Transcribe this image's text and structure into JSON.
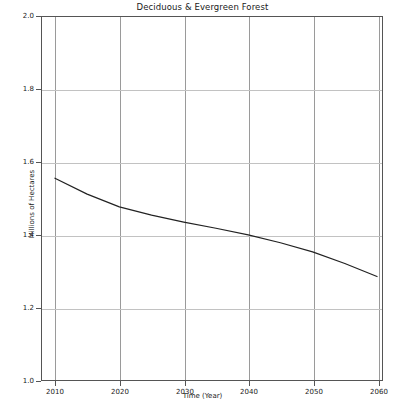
{
  "chart_data": {
    "type": "line",
    "title": "Deciduous & Evergreen Forest",
    "xlabel": "Time (Year)",
    "ylabel": "Millions of Hectares",
    "xlim": [
      2010,
      2060
    ],
    "ylim": [
      1.0,
      2.0
    ],
    "grid": true,
    "legend": null,
    "xticks": [
      "2010",
      "2020",
      "2030",
      "2040",
      "2050",
      "2060"
    ],
    "yticks": [
      "1.0",
      "1.2",
      "1.4",
      "1.6",
      "1.8",
      "2.0"
    ],
    "x": [
      2010,
      2015,
      2020,
      2025,
      2030,
      2035,
      2040,
      2045,
      2050,
      2055,
      2060
    ],
    "values": [
      1.556,
      1.512,
      1.477,
      1.454,
      1.435,
      1.418,
      1.4,
      1.378,
      1.353,
      1.321,
      1.285
    ],
    "series": [
      {
        "name": "Deciduous & Evergreen Forest",
        "color": "#222222",
        "values": [
          1.556,
          1.512,
          1.477,
          1.454,
          1.435,
          1.418,
          1.4,
          1.378,
          1.353,
          1.321,
          1.285
        ]
      }
    ]
  },
  "axes": {
    "y_tick_labels": [
      "2.0",
      "1.8",
      "1.6",
      "1.4",
      "1.2",
      "1.0"
    ],
    "x_tick_labels": [
      "2010",
      "2020",
      "2030",
      "2040",
      "2050",
      "2060"
    ]
  },
  "colors": {
    "series_line": "#222222",
    "gridline_vertical": "#9a9a9a",
    "gridline_horizontal": "#c2c2c2",
    "frame": "#555555",
    "background": "#ffffff"
  }
}
